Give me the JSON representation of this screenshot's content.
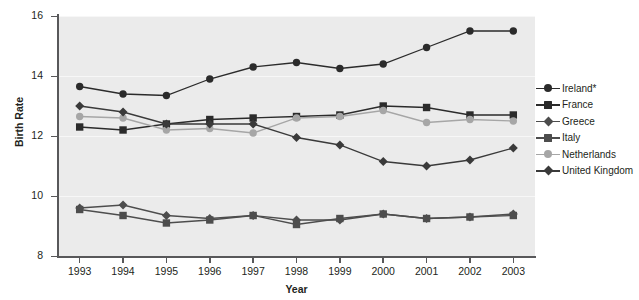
{
  "chart_data": {
    "type": "line",
    "title": "",
    "xlabel": "Year",
    "ylabel": "Birth Rate",
    "x": [
      1993,
      1994,
      1995,
      1996,
      1997,
      1998,
      1999,
      2000,
      2001,
      2002,
      2003
    ],
    "xtick_labels": [
      "1993",
      "1994",
      "1995",
      "1996",
      "1997",
      "1998",
      "1999",
      "2000",
      "2001",
      "2002",
      "2003"
    ],
    "ytick_labels": [
      "8",
      "10",
      "12",
      "14",
      "16"
    ],
    "yticks": [
      8,
      10,
      12,
      14,
      16
    ],
    "ylim": [
      8,
      16
    ],
    "grid": true,
    "legend_position": "right",
    "plot_background": "#ebebeb",
    "series": [
      {
        "name": "Ireland*",
        "marker": "circle",
        "color": "#2b2b2b",
        "values": [
          13.65,
          13.4,
          13.35,
          13.9,
          14.3,
          14.45,
          14.25,
          14.4,
          14.95,
          15.5,
          15.5
        ]
      },
      {
        "name": "France",
        "marker": "square",
        "color": "#2b2b2b",
        "values": [
          12.3,
          12.2,
          12.4,
          12.55,
          12.6,
          12.65,
          12.7,
          13.0,
          12.95,
          12.7,
          12.7
        ]
      },
      {
        "name": "Greece",
        "marker": "diamond",
        "color": "#4d4d4d",
        "values": [
          9.6,
          9.7,
          9.35,
          9.25,
          9.35,
          9.2,
          9.2,
          9.4,
          9.25,
          9.3,
          9.4
        ]
      },
      {
        "name": "Italy",
        "marker": "square",
        "color": "#4d4d4d",
        "values": [
          9.55,
          9.35,
          9.1,
          9.2,
          9.35,
          9.05,
          9.25,
          9.4,
          9.25,
          9.3,
          9.35
        ]
      },
      {
        "name": "Netherlands",
        "marker": "circle",
        "color": "#a6a6a6",
        "values": [
          12.65,
          12.6,
          12.2,
          12.25,
          12.1,
          12.6,
          12.65,
          12.85,
          12.45,
          12.55,
          12.5
        ]
      },
      {
        "name": "United Kingdom",
        "marker": "diamond",
        "color": "#3a3a3a",
        "values": [
          13.0,
          12.8,
          12.4,
          12.4,
          12.4,
          11.95,
          11.7,
          11.15,
          11.0,
          11.2,
          11.6
        ]
      }
    ]
  },
  "legend": {
    "items": [
      {
        "label": "Ireland*"
      },
      {
        "label": "France"
      },
      {
        "label": "Greece"
      },
      {
        "label": "Italy"
      },
      {
        "label": "Netherlands"
      },
      {
        "label": "United Kingdom"
      }
    ]
  }
}
